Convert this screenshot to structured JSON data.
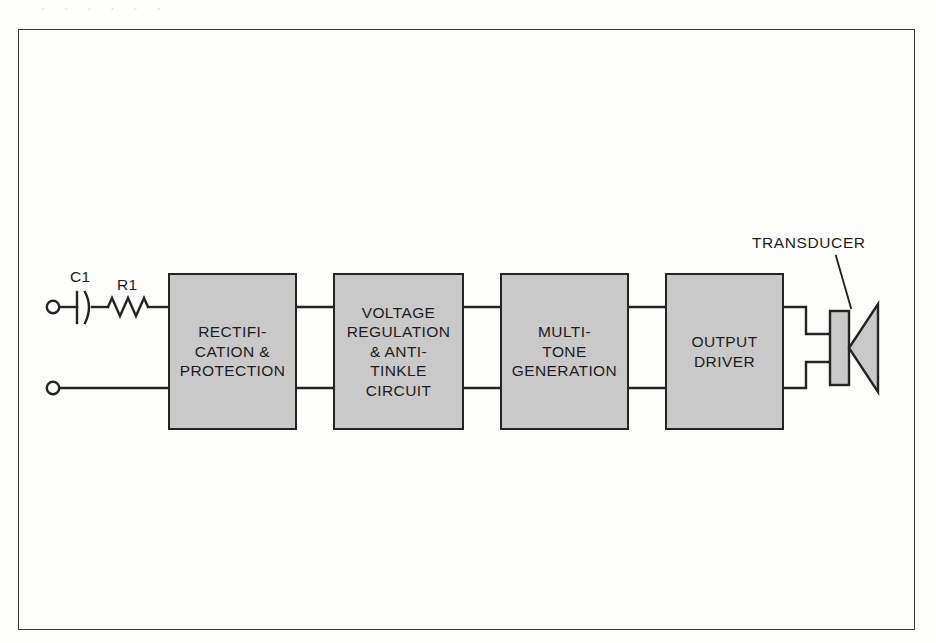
{
  "figure": {
    "type": "block-diagram",
    "background_color": "#fdfdfc",
    "border_color": "#3d3d3d",
    "block_fill_color": "#c9c9c9",
    "block_border_color": "#242424",
    "line_color": "#242424",
    "scan_bleed_text": "· · · · · ·"
  },
  "input": {
    "terminals": [
      {
        "name": "top-terminal",
        "x": 52,
        "y": 307
      },
      {
        "name": "bottom-terminal",
        "x": 52,
        "y": 388
      }
    ],
    "components": [
      {
        "id": "capacitor",
        "label": "C1",
        "symbol": "capacitor-polarized"
      },
      {
        "id": "resistor",
        "label": "R1",
        "symbol": "resistor-zigzag"
      }
    ]
  },
  "blocks": [
    {
      "id": "rectification",
      "label": "RECTIFI-\nCATION &\nPROTECTION",
      "x": 168,
      "y": 273,
      "w": 129,
      "h": 157
    },
    {
      "id": "voltage-regulation",
      "label": "VOLTAGE\nREGULATION\n& ANTI-\nTINKLE\nCIRCUIT",
      "x": 333,
      "y": 273,
      "w": 131,
      "h": 157
    },
    {
      "id": "multi-tone",
      "label": "MULTI-\nTONE\nGENERATION",
      "x": 500,
      "y": 273,
      "w": 129,
      "h": 157
    },
    {
      "id": "output-driver",
      "label": "OUTPUT\nDRIVER",
      "x": 665,
      "y": 273,
      "w": 119,
      "h": 157
    }
  ],
  "output": {
    "transducer_label": "TRANSDUCER",
    "symbol": "speaker-icon"
  }
}
